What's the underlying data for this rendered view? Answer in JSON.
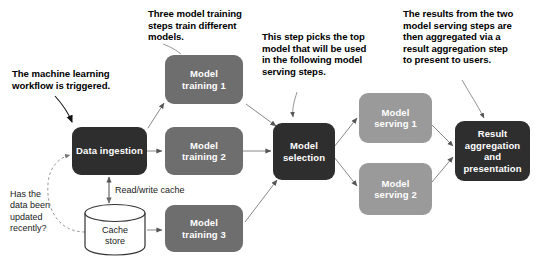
{
  "diagram": {
    "background_color": "#ffffff",
    "colors": {
      "dark_node": "#2e2e2e",
      "mid_node": "#6e6e6e",
      "light_node": "#9a9a9a",
      "node_text": "#ffffff",
      "annotation_text": "#000000",
      "arrow": "#555555",
      "dashed_arrow": "#777777"
    }
  },
  "nodes": {
    "data_ingestion": "Data ingestion",
    "model_training_1": "Model\ntraining 1",
    "model_training_1_line1": "Model",
    "model_training_1_line2": "training 1",
    "model_training_2_line1": "Model",
    "model_training_2_line2": "training 2",
    "model_training_3_line1": "Model",
    "model_training_3_line2": "training 3",
    "model_selection_line1": "Model",
    "model_selection_line2": "selection",
    "model_serving_1_line1": "Model",
    "model_serving_1_line2": "serving 1",
    "model_serving_2_line1": "Model",
    "model_serving_2_line2": "serving 2",
    "result_line1": "Result",
    "result_line2": "aggregation",
    "result_line3": "and",
    "result_line4": "presentation",
    "cache_store_line1": "Cache",
    "cache_store_line2": "store"
  },
  "annotations": {
    "workflow_trigger_line1": "The machine learning",
    "workflow_trigger_line2": "workflow is triggered.",
    "three_training_line1": "Three model training",
    "three_training_line2": "steps train different",
    "three_training_line3": "models.",
    "top_model_line1": "This step picks the top",
    "top_model_line2": "model that will be used",
    "top_model_line3": "in the following model",
    "top_model_line4": "serving steps.",
    "results_line1": "The results from the two",
    "results_line2": "model serving steps are",
    "results_line3": "then aggregated via a",
    "results_line4": "result aggregation step",
    "results_line5": "to present to users."
  },
  "edge_labels": {
    "read_write_cache": "Read/write cache",
    "has_data_been_updated_line1": "Has the",
    "has_data_been_updated_line2": "data been",
    "has_data_been_updated_line3": "updated",
    "has_data_been_updated_line4": "recently?"
  }
}
